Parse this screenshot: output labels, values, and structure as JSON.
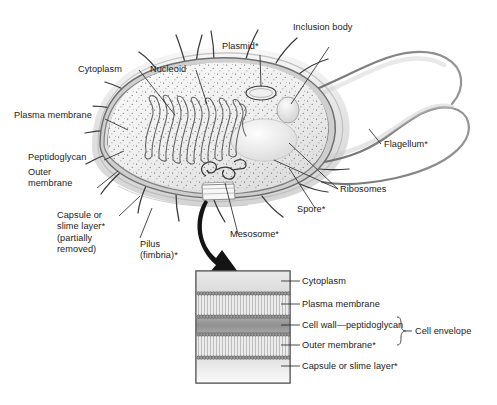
{
  "figure": {
    "footnote_marker": "*",
    "colors": {
      "ink": "#1a1a1a",
      "leader": "#2b2b2b",
      "envelope_dark": "#6f6f6f",
      "cellwall_gray": "#9a9a9a",
      "capsule_gray": "#c9c9c9",
      "cytoplasm_pale": "#ececec",
      "inset_border": "#555555",
      "arrow_black": "#141414"
    }
  },
  "main_cell": {
    "labels": [
      {
        "id": "cytoplasm",
        "text": "Cytoplasm"
      },
      {
        "id": "nucleoid",
        "text": "Nucleoid"
      },
      {
        "id": "plasmid",
        "text": "Plasmid*"
      },
      {
        "id": "inclusion_body",
        "text": "Inclusion body"
      },
      {
        "id": "plasma_membrane",
        "text": "Plasma membrane"
      },
      {
        "id": "peptidoglycan",
        "text": "Peptidoglycan"
      },
      {
        "id": "outer_membrane",
        "text": "Outer\nmembrane"
      },
      {
        "id": "capsule",
        "text": "Capsule or\nslime layer*\n(partially\nremoved)"
      },
      {
        "id": "pilus",
        "text": "Pilus\n(fimbria)*"
      },
      {
        "id": "mesosome",
        "text": "Mesosome*"
      },
      {
        "id": "spore",
        "text": "Spore*"
      },
      {
        "id": "ribosomes",
        "text": "Ribosomes"
      },
      {
        "id": "flagellum",
        "text": "Flagellum*"
      }
    ]
  },
  "inset": {
    "caption_bracket": "Cell envelope",
    "layers": [
      {
        "id": "cytoplasm",
        "label": "Cytoplasm",
        "kind": "gradient-pale"
      },
      {
        "id": "plasma_membrane",
        "label": "Plasma membrane",
        "kind": "bilayer"
      },
      {
        "id": "cell_wall",
        "label": "Cell wall—peptidoglycan",
        "kind": "solid-gray"
      },
      {
        "id": "outer_membrane",
        "label": "Outer membrane*",
        "kind": "bilayer"
      },
      {
        "id": "capsule",
        "label": "Capsule or slime layer*",
        "kind": "gradient-pale"
      }
    ],
    "envelope_members": [
      "cell_wall",
      "outer_membrane"
    ]
  }
}
